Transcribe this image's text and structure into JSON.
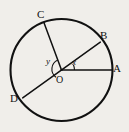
{
  "figure": {
    "type": "circle-geometry-diagram",
    "background_color": "#f0eeea",
    "stroke_color": "#111111",
    "text_color": "#111111",
    "canvas": {
      "width": 129,
      "height": 132
    }
  },
  "circle": {
    "center_label": "O",
    "center": {
      "x": 61.5,
      "y": 70.0
    },
    "radius": 51.0,
    "stroke_width": 2.0
  },
  "points": [
    {
      "id": "A",
      "label": "A",
      "x": 112.5,
      "y": 70.0,
      "label_x": 113,
      "label_y": 64,
      "on_circle": true
    },
    {
      "id": "B",
      "label": "B",
      "x": 100.3,
      "y": 42.1,
      "label_x": 101,
      "label_y": 31,
      "on_circle": true
    },
    {
      "id": "C",
      "label": "C",
      "x": 43.9,
      "y": 22.4,
      "label_x": 38,
      "label_y": 10,
      "on_circle": true
    },
    {
      "id": "D",
      "label": "D",
      "x": 22.7,
      "y": 97.9,
      "label_x": 11,
      "label_y": 94,
      "on_circle": true
    }
  ],
  "segments": [
    {
      "id": "OA",
      "from": "O",
      "to": "A",
      "kind": "radius",
      "stroke_width": 1.6
    },
    {
      "id": "BD",
      "from": "B",
      "to": "D",
      "kind": "diameter",
      "stroke_width": 1.6
    },
    {
      "id": "OC",
      "from": "O",
      "to": "C",
      "kind": "radius",
      "stroke_width": 1.6
    }
  ],
  "angles": [
    {
      "id": "x",
      "label": "x",
      "vertex": "O",
      "between": [
        "OB",
        "OA"
      ],
      "label_x": 73,
      "label_y": 61,
      "arc_radius": 13,
      "start_deg": 0,
      "end_deg": 24
    },
    {
      "id": "y",
      "label": "y",
      "vertex": "O",
      "between": [
        "OC",
        "OD"
      ],
      "label_x": 47,
      "label_y": 58,
      "arc_radius": 9,
      "start_deg": 114,
      "end_deg": 204
    }
  ],
  "center_label": {
    "text": "O",
    "label_x": 56,
    "label_y": 72
  }
}
